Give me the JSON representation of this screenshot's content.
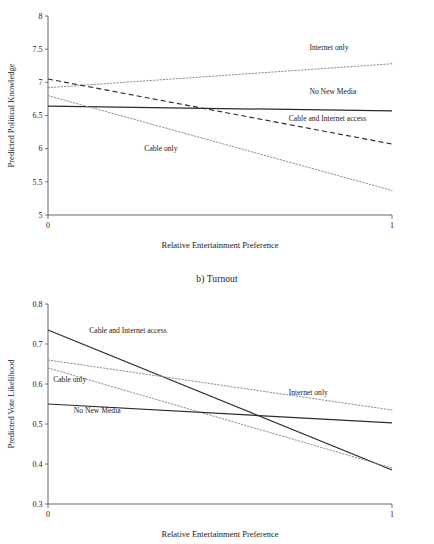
{
  "figure": {
    "panel_b_title": "b) Turnout"
  },
  "chart_data": [
    {
      "type": "line",
      "id": "political-knowledge",
      "title": "",
      "xlabel": "Relative Entertainment Preference",
      "ylabel": "Predicted Political Knowledge",
      "xlim": [
        0,
        1
      ],
      "ylim": [
        5,
        8
      ],
      "xticks": [
        0,
        1
      ],
      "xtick_labels": [
        "0",
        "1"
      ],
      "yticks": [
        5,
        5.5,
        6,
        6.5,
        7,
        7.5,
        8
      ],
      "ytick_labels": [
        "5",
        "5.5",
        "6",
        "6.5",
        "7",
        "7.5",
        "8"
      ],
      "grid": false,
      "legend": "inline-annotations",
      "x": [
        0,
        1
      ],
      "series": [
        {
          "name": "Internet only",
          "values": [
            6.92,
            7.28
          ],
          "style": "dotted",
          "color": "#8e8e8e",
          "label_x": 0.76,
          "label_y": 7.49
        },
        {
          "name": "No New Media",
          "values": [
            6.64,
            6.57
          ],
          "style": "solid",
          "color": "#2b2b2b",
          "label_x": 0.76,
          "label_y": 6.83
        },
        {
          "name": "Cable and Internet access",
          "values": [
            7.05,
            6.07
          ],
          "style": "dashed",
          "color": "#2b2b2b",
          "label_x": 0.7,
          "label_y": 6.41
        },
        {
          "name": "Cable only",
          "values": [
            6.8,
            5.37
          ],
          "style": "dotted",
          "color": "#8e8e8e",
          "label_x": 0.28,
          "label_y": 5.97
        }
      ]
    },
    {
      "type": "line",
      "id": "turnout",
      "title": "b) Turnout",
      "xlabel": "Relative Entertainment Preference",
      "ylabel": "Predicted Vote Likelihood",
      "xlim": [
        0,
        1
      ],
      "ylim": [
        0.3,
        0.8
      ],
      "xticks": [
        0,
        1
      ],
      "xtick_labels": [
        "0",
        "1"
      ],
      "yticks": [
        0.3,
        0.4,
        0.5,
        0.6,
        0.7,
        0.8
      ],
      "ytick_labels": [
        "0.3",
        "0.4",
        "0.5",
        "0.6",
        "0.7",
        "0.8"
      ],
      "grid": false,
      "legend": "inline-annotations",
      "x": [
        0,
        1
      ],
      "series": [
        {
          "name": "Cable and Internet access",
          "values": [
            0.735,
            0.385
          ],
          "style": "solid",
          "color": "#2b2b2b",
          "label_x": 0.12,
          "label_y": 0.727
        },
        {
          "name": "Internet only",
          "values": [
            0.66,
            0.535
          ],
          "style": "dotted",
          "color": "#8e8e8e",
          "label_x": 0.7,
          "label_y": 0.573
        },
        {
          "name": "Cable only",
          "values": [
            0.64,
            0.39
          ],
          "style": "dotted",
          "color": "#8e8e8e",
          "label_x": 0.015,
          "label_y": 0.605
        },
        {
          "name": "No New Media",
          "values": [
            0.55,
            0.503
          ],
          "style": "solid",
          "color": "#2b2b2b",
          "label_x": 0.075,
          "label_y": 0.527
        }
      ]
    }
  ]
}
